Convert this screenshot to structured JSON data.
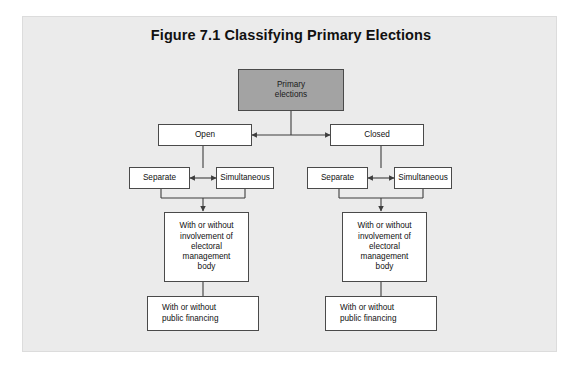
{
  "figure": {
    "title": "Figure 7.1 Classifying Primary Elections",
    "root": {
      "line1": "Primary",
      "line2": "elections"
    },
    "branches": {
      "open": "Open",
      "closed": "Closed"
    },
    "timing": {
      "separate": "Separate",
      "simultaneous": "Simultaneous"
    },
    "emb": {
      "line1": "With or without",
      "line2": "involvement of",
      "line3": "electoral",
      "line4": "management",
      "line5": "body"
    },
    "financing": {
      "line1": "With or without",
      "line2": "public financing"
    }
  },
  "colors": {
    "page_background": "#ebebeb",
    "root_box_fill": "#a3a3a3",
    "box_fill": "#ffffff",
    "stroke": "#4a4a4a",
    "text": "#111111"
  }
}
